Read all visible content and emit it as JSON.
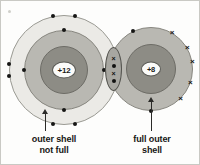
{
  "diagram": {
    "type": "atomic-bonding-shell-diagram",
    "atoms": [
      {
        "id": "atom-left",
        "name": "magnesium-atom",
        "nucleus_charge": "+12",
        "shell_count": 3,
        "outer_shell_full": false,
        "electron_symbol": "dot",
        "electrons": [
          {
            "shell": 3,
            "angle_deg": 258,
            "symbol": "dot"
          },
          {
            "shell": 3,
            "angle_deg": 282,
            "symbol": "dot"
          },
          {
            "shell": 3,
            "angle_deg": 174,
            "symbol": "dot"
          },
          {
            "shell": 3,
            "angle_deg": 186,
            "symbol": "dot"
          },
          {
            "shell": 3,
            "angle_deg": 78,
            "symbol": "dot"
          },
          {
            "shell": 3,
            "angle_deg": 102,
            "symbol": "dot"
          },
          {
            "shell": 3,
            "angle_deg": 354,
            "symbol": "dot"
          },
          {
            "shell": 3,
            "angle_deg": 6,
            "symbol": "dot"
          },
          {
            "shell": 2,
            "angle_deg": 270,
            "symbol": "dot"
          },
          {
            "shell": 2,
            "angle_deg": 90,
            "symbol": "dot"
          },
          {
            "shell": 2,
            "angle_deg": 180,
            "symbol": "dot"
          },
          {
            "shell": 2,
            "angle_deg": 0,
            "symbol": "dot"
          }
        ]
      },
      {
        "id": "atom-right",
        "name": "oxygen-atom",
        "nucleus_charge": "+8",
        "shell_count": 2,
        "outer_shell_full": true,
        "electron_symbol": "cross",
        "electrons": [
          {
            "shell": 2,
            "angle_deg": 300,
            "symbol": "cross"
          },
          {
            "shell": 2,
            "angle_deg": 330,
            "symbol": "cross"
          },
          {
            "shell": 2,
            "angle_deg": 350,
            "symbol": "cross"
          },
          {
            "shell": 2,
            "angle_deg": 20,
            "symbol": "cross"
          },
          {
            "shell": 2,
            "angle_deg": 45,
            "symbol": "cross"
          },
          {
            "shell": 2,
            "angle_deg": 90,
            "symbol": "dot"
          },
          {
            "shell": 2,
            "angle_deg": 245,
            "symbol": "dot"
          }
        ]
      }
    ],
    "shared_region": {
      "name": "shared-electron-pair-region",
      "marks": [
        "×",
        "•",
        "×",
        "•"
      ]
    },
    "callouts": [
      {
        "name": "outer-shell-not-full-label",
        "line1": "outer shell",
        "line2": "not full",
        "points_to": "atom-left-outer-shell"
      },
      {
        "name": "full-outer-shell-label",
        "line1": "full outer",
        "line2": "shell",
        "points_to": "atom-right-outer-shell"
      }
    ],
    "colors": {
      "background": "#fdfdfc",
      "shell_outer": "#ebeae6",
      "shell_middle": "#b9b8b2",
      "shell_inner": "#8d8c85",
      "nucleus_fill": "#fbfbf9",
      "ink": "#161615",
      "overlap_fill": "#a8a7a1"
    }
  }
}
